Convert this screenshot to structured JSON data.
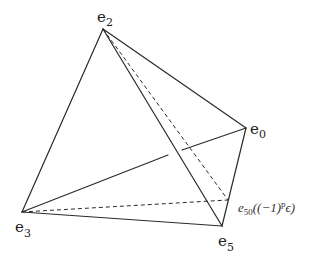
{
  "figure": {
    "type": "tetrahedron-diagram",
    "vertices": [
      {
        "id": "e2",
        "label": "e",
        "subscript": "2",
        "x": 103,
        "y": 29
      },
      {
        "id": "e0",
        "label": "e",
        "subscript": "0",
        "x": 246,
        "y": 128
      },
      {
        "id": "e3",
        "label": "e",
        "subscript": "3",
        "x": 22,
        "y": 212
      },
      {
        "id": "e5",
        "label": "e",
        "subscript": "5",
        "x": 222,
        "y": 226
      }
    ],
    "special_point": {
      "id": "e50",
      "label_base": "e",
      "label_sub": "50",
      "label_arg": "((−1)",
      "label_sup": "p",
      "label_tail": "ϵ)",
      "x": 228,
      "y": 200
    },
    "solid_edges": [
      "e2-e3",
      "e2-e0",
      "e2-e5",
      "e3-e5",
      "e0-e5",
      "e3-e0 (hidden-break)"
    ],
    "dashed_edges": [
      "e2-e50",
      "e3-e50"
    ],
    "line_color": "#2a2a2a"
  }
}
